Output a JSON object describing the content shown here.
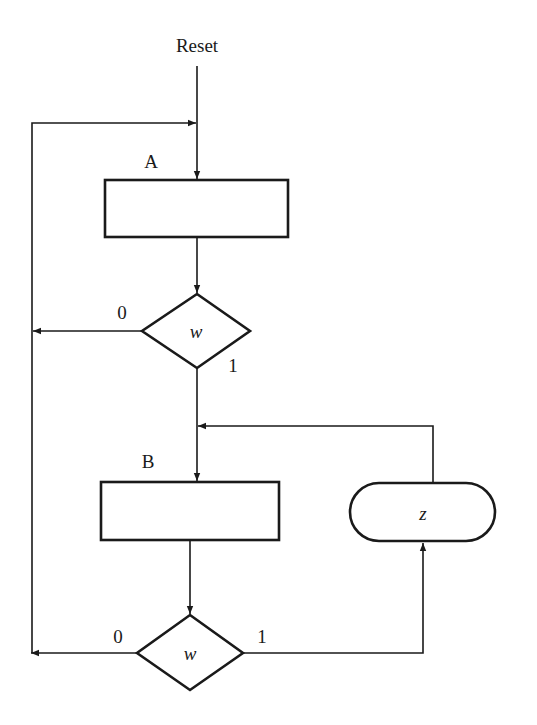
{
  "diagram": {
    "type": "ASM chart",
    "entry_label": "Reset",
    "states": [
      {
        "id": "A",
        "label": "A"
      },
      {
        "id": "B",
        "label": "B"
      }
    ],
    "decisions": [
      {
        "id": "d1",
        "condition": "w",
        "false_label": "0",
        "true_label": "1"
      },
      {
        "id": "d2",
        "condition": "w",
        "false_label": "0",
        "true_label": "1"
      }
    ],
    "conditional_outputs": [
      {
        "id": "out-z",
        "label": "z"
      }
    ],
    "colors": {
      "stroke": "#1a1a1a",
      "background": "#ffffff"
    }
  }
}
